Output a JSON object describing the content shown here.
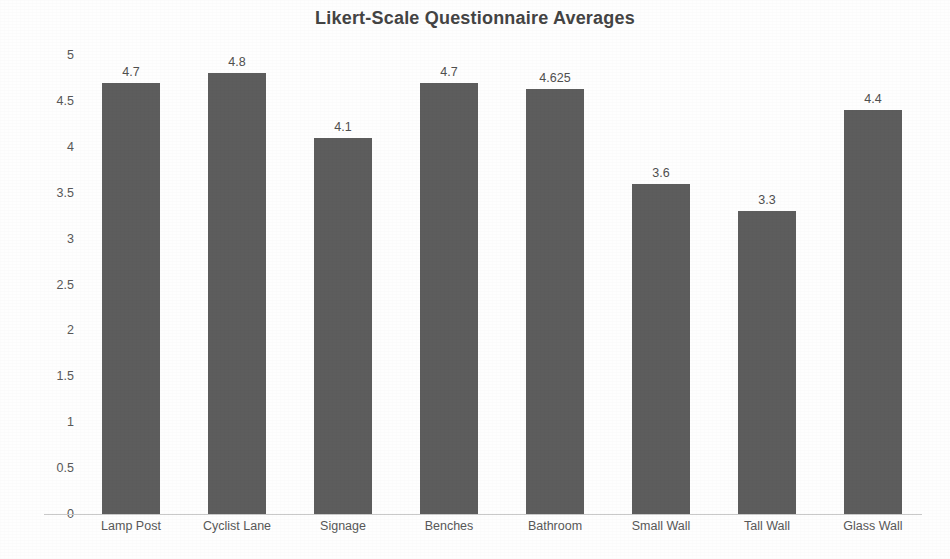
{
  "chart_data": {
    "type": "bar",
    "title": "Likert-Scale Questionnaire Averages",
    "xlabel": "",
    "ylabel": "",
    "categories": [
      "Lamp Post",
      "Cyclist Lane",
      "Signage",
      "Benches",
      "Bathroom",
      "Small Wall",
      "Tall Wall",
      "Glass Wall"
    ],
    "values": [
      4.7,
      4.8,
      4.1,
      4.7,
      4.625,
      3.6,
      3.3,
      4.4
    ],
    "value_labels": [
      "4.7",
      "4.8",
      "4.1",
      "4.7",
      "4.625",
      "3.6",
      "3.3",
      "4.4"
    ],
    "ylim": [
      0,
      5
    ],
    "ytick_labels": [
      "5",
      "4.5",
      "4",
      "3.5",
      "3",
      "2.5",
      "2",
      "1.5",
      "1",
      "0.5",
      "0"
    ],
    "ytick_values": [
      5,
      4.5,
      4,
      3.5,
      3,
      2.5,
      2,
      1.5,
      1,
      0.5,
      0
    ],
    "grid": false,
    "legend": false,
    "bar_color": "#5d5d5d",
    "axis_color": "#c9c9c9",
    "title_color": "#444444",
    "label_color": "#585858",
    "background": "#ffffff"
  }
}
